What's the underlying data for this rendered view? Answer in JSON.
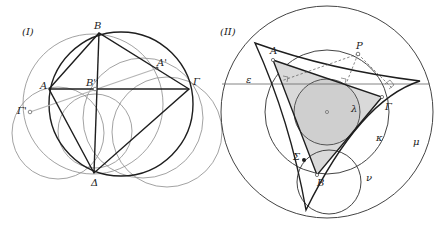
{
  "figures": [
    {
      "id": "I",
      "label": "(I)",
      "points": {
        "A": {
          "label": "A",
          "x": 49,
          "y": 89
        },
        "B": {
          "label": "B",
          "x": 99,
          "y": 33
        },
        "Gamma": {
          "label": "Γ",
          "x": 189,
          "y": 89
        },
        "Delta": {
          "label": "Δ",
          "x": 94,
          "y": 173
        },
        "A_prime": {
          "label": "A'",
          "x": 157,
          "y": 68
        },
        "B_prime": {
          "label": "B'",
          "x": 95,
          "y": 89
        },
        "Gamma_prime": {
          "label": "Γ'",
          "x": 30,
          "y": 112
        }
      }
    },
    {
      "id": "II",
      "label": "(II)",
      "points": {
        "A": {
          "label": "A",
          "x": 273,
          "y": 60
        },
        "B": {
          "label": "B",
          "x": 317,
          "y": 175
        },
        "Gamma": {
          "label": "Γ",
          "x": 382,
          "y": 97
        },
        "P": {
          "label": "P",
          "x": 358,
          "y": 54
        },
        "Sigma": {
          "label": "Σ",
          "x": 304,
          "y": 160
        }
      },
      "line_labels": {
        "epsilon": "ε"
      },
      "circle_labels": {
        "lambda": "λ",
        "kappa": "κ",
        "mu": "μ",
        "nu": "ν"
      }
    }
  ],
  "colors": {
    "stroke_dark": "#1e1e1e",
    "stroke_light": "#8a8a8a",
    "simson_line": "#b5b5b5",
    "triangle_fill": "#d9d9d9",
    "incircle_fill": "#cfcfcf"
  }
}
